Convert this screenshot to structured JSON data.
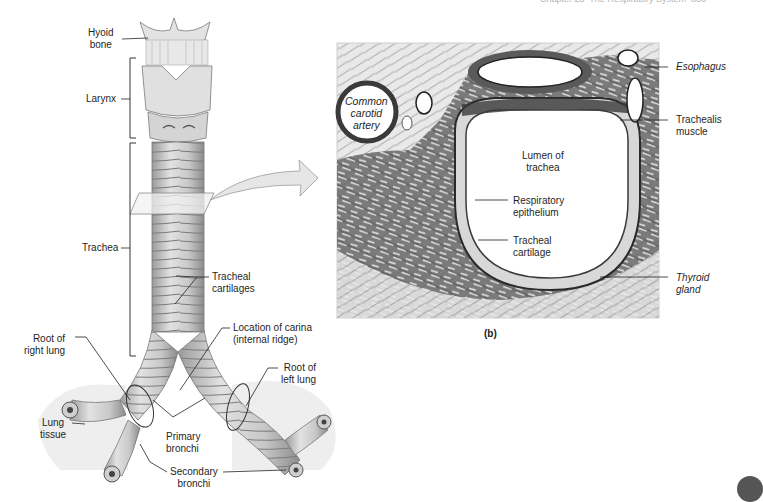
{
  "running_header": "Chapter 23  The Respiratory System  833",
  "panel_a": {
    "labels": {
      "hyoid_bone": "Hyoid\nbone",
      "larynx": "Larynx",
      "trachea": "Trachea",
      "tracheal_cartilages": "Tracheal\ncartilages",
      "location_of_carina": "Location of carina\n(internal ridge)",
      "root_of_right_lung": "Root of\nright lung",
      "root_of_left_lung": "Root of\nleft lung",
      "lung_tissue": "Lung\ntissue",
      "primary_bronchi": "Primary\nbronchi",
      "secondary_bronchi": "Secondary\nbronchi"
    }
  },
  "panel_b": {
    "caption": "(b)",
    "labels": {
      "common_carotid_artery": "Common\ncarotid\nartery",
      "esophagus": "Esophagus",
      "trachealis_muscle": "Trachealis\nmuscle",
      "lumen_of_trachea": "Lumen of\ntrachea",
      "respiratory_epithelium": "Respiratory\nepithelium",
      "tracheal_cartilage": "Tracheal\ncartilage",
      "thyroid_gland": "Thyroid\ngland"
    }
  },
  "colors": {
    "tissue_dark": "#4a4a4a",
    "tissue_mid": "#8a8a8a",
    "cartilage_light": "#d9d9d9",
    "arrow_fill": "#e6e6e6",
    "lung_bg": "#ececec"
  }
}
